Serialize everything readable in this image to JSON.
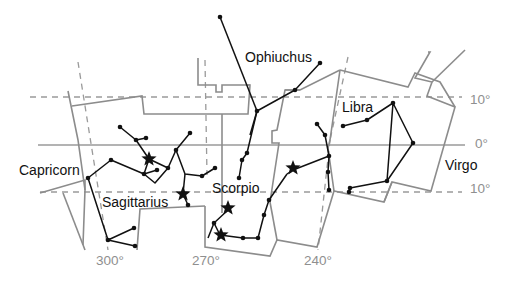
{
  "colors": {
    "background": "#ffffff",
    "boundary": "#8c8c8c",
    "grid": "#9a9a9a",
    "lines": "#111111",
    "axis_text": "#8f8f8f",
    "label_text": "#111111"
  },
  "axes": {
    "dec_labels": [
      {
        "text": "10°",
        "x": 470,
        "y": 104
      },
      {
        "text": "0°",
        "x": 475,
        "y": 148
      },
      {
        "text": "10°",
        "x": 470,
        "y": 193
      }
    ],
    "ra_labels": [
      {
        "text": "300°",
        "x": 96,
        "y": 265
      },
      {
        "text": "270°",
        "x": 192,
        "y": 265
      },
      {
        "text": "240°",
        "x": 304,
        "y": 265
      }
    ]
  },
  "constellations": [
    {
      "name": "Ophiuchus",
      "label_x": 245,
      "label_y": 62
    },
    {
      "name": "Libra",
      "label_x": 342,
      "label_y": 112
    },
    {
      "name": "Capricorn",
      "label_x": 19,
      "label_y": 175
    },
    {
      "name": "Sagittarius",
      "label_x": 102,
      "label_y": 207
    },
    {
      "name": "Scorpio",
      "label_x": 212,
      "label_y": 193
    },
    {
      "name": "Virgo",
      "label_x": 445,
      "label_y": 170
    }
  ],
  "gridlines": {
    "dec_plus10_y": 97,
    "equator_y": 145,
    "dec_minus10_y": 192,
    "ra_lines": [
      "M 78 62 L 108 250",
      "M 205 60 L 207 175",
      "M 348 57 L 330 140",
      "M 330 140 L 318 250"
    ]
  },
  "boundaries": [
    "M 68 91 L 78 140 L 85 190 L 83 245",
    "M 72 106 L 142 96 L 144 114 L 222 114 L 248 114 L 250 85 L 248 85",
    "M 198 58 L 198 85 L 216 85 L 216 92 L 222 92 L 222 85 L 250 85",
    "M 222 114 L 222 213",
    "M 40 193 L 85 180 L 85 190",
    "M 137 250 L 140 209 L 205 206",
    "M 205 206 L 205 247 L 270 256 L 277 240 L 317 247 L 334 191 L 384 202 L 392 182 L 431 191 L 455 107 L 427 96 L 432 82 L 415 78 L 430 52 L 428 52",
    "M 384 202 L 392 182",
    "M 340 70 L 408 87 L 415 73 L 440 82 L 455 107",
    "M 340 70 L 330 140 L 328 148 L 334 191",
    "M 300 90 L 285 90 L 277 130 L 272 131 L 272 143 L 279 143 L 270 202",
    "M 285 90 L 300 90 L 340 70",
    "M 432 82 L 465 50",
    "M 270 202 L 277 240",
    "M 63 193 L 85 250"
  ],
  "stick_figures": [
    {
      "name": "Ophiuchus",
      "paths": [
        "M 220 17 L 257 111",
        "M 257 111 L 295 90 L 320 63",
        "M 257 111 L 247 153 L 242 160 L 239 178",
        "M 257 111 L 250 135"
      ]
    },
    {
      "name": "Sagittarius",
      "paths": [
        "M 120 127 L 136 140 L 146 138",
        "M 136 140 L 149 159 L 144 174 L 157 170",
        "M 144 174 L 155 183 L 168 168 L 176 150 L 190 133",
        "M 176 150 L 185 174 L 202 176 L 215 168",
        "M 185 174 L 183 194 L 188 205",
        "M 149 159 L 168 168",
        "M 144 174 L 111 160 L 88 178 L 108 240 L 134 228",
        "M 108 240 L 135 246"
      ]
    },
    {
      "name": "Scorpio",
      "paths": [
        "M 208 238 L 214 223 L 228 210",
        "M 214 223 L 220 235",
        "M 220 235 L 243 238 L 258 238 L 264 215 L 269 200 L 287 174",
        "M 287 174 L 293 170 L 329 156",
        "M 329 156 L 325 135 L 317 124",
        "M 329 156 L 328 172 L 329 190"
      ]
    },
    {
      "name": "Libra",
      "paths": [
        "M 343 126 L 367 120 L 393 103 L 413 143 L 387 181 L 393 103",
        "M 387 181 L 350 188 L 349 192"
      ]
    }
  ],
  "stars_small": [
    [
      220,
      17
    ],
    [
      320,
      63
    ],
    [
      295,
      90
    ],
    [
      257,
      111
    ],
    [
      239,
      178
    ],
    [
      242,
      160
    ],
    [
      247,
      153
    ],
    [
      120,
      127
    ],
    [
      136,
      140
    ],
    [
      146,
      138
    ],
    [
      157,
      170
    ],
    [
      144,
      174
    ],
    [
      168,
      168
    ],
    [
      176,
      150
    ],
    [
      190,
      133
    ],
    [
      202,
      176
    ],
    [
      215,
      168
    ],
    [
      188,
      205
    ],
    [
      111,
      160
    ],
    [
      88,
      178
    ],
    [
      108,
      240
    ],
    [
      134,
      228
    ],
    [
      135,
      246
    ],
    [
      214,
      223
    ],
    [
      243,
      238
    ],
    [
      258,
      238
    ],
    [
      264,
      215
    ],
    [
      269,
      200
    ],
    [
      317,
      124
    ],
    [
      329,
      156
    ],
    [
      328,
      172
    ],
    [
      329,
      190
    ],
    [
      325,
      135
    ],
    [
      343,
      126
    ],
    [
      367,
      120
    ],
    [
      393,
      103
    ],
    [
      413,
      143
    ],
    [
      387,
      181
    ],
    [
      350,
      188
    ],
    [
      349,
      192
    ]
  ],
  "stars_big": [
    {
      "name": "Sagittarius-kaus",
      "x": 149,
      "y": 159
    },
    {
      "name": "Sagittarius-nunki",
      "x": 183,
      "y": 194
    },
    {
      "name": "Scorpio-shaula",
      "x": 228,
      "y": 208
    },
    {
      "name": "Scorpio-sargas",
      "x": 221,
      "y": 235
    },
    {
      "name": "Scorpio-antares",
      "x": 293,
      "y": 168
    }
  ]
}
